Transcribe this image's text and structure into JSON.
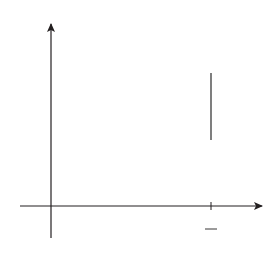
{
  "figure": {
    "axes": {
      "x_label": "x",
      "y_label": "y",
      "origin_label": "0"
    },
    "tick": {
      "numerator": "1",
      "denominator": "2",
      "value": 0.5
    },
    "curves": [
      {
        "name": "parabola",
        "label_lhs": "y = x",
        "label_exp": "2",
        "color": "#e4553a",
        "expr": "x^2"
      },
      {
        "name": "cubic",
        "label_lhs": "y = x",
        "label_exp": "3",
        "color": "#2d4c94",
        "expr": "x^3"
      }
    ],
    "shaded_region": {
      "from": 0,
      "to": 0.5,
      "between": [
        "x^2",
        "x^3"
      ],
      "fill": "#c9d8ee"
    },
    "colors": {
      "axis": "#231f20",
      "red_curve": "#e4553a",
      "blue_curve": "#2d4c94",
      "fill": "#c9d8ee"
    }
  }
}
